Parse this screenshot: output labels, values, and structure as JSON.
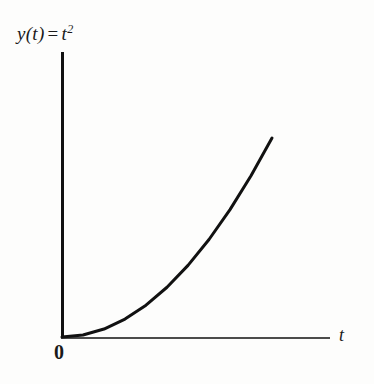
{
  "figure": {
    "background_color": "#fdfdfc",
    "ink_color": "#111111",
    "y_axis_label_main": "y(t)",
    "y_axis_label_operator": "=",
    "y_axis_label_var": "t",
    "y_axis_label_exponent": "2",
    "x_axis_label": "t",
    "origin_label": "0"
  },
  "chart_data": {
    "type": "line",
    "xlabel": "t",
    "ylabel": "y(t) = t²",
    "origin_tick_label": "0",
    "grid": false,
    "legend": null,
    "xlim": [
      0,
      1.18
    ],
    "ylim": [
      0,
      1.4
    ],
    "curve_color": "#111111",
    "curve_linewidth_px": 3,
    "axis_color": "#111111",
    "series": [
      {
        "name": "y = t^2",
        "x": [
          0.0,
          0.1,
          0.2,
          0.3,
          0.4,
          0.5,
          0.6,
          0.7,
          0.8,
          0.9,
          1.0
        ],
        "y": [
          0.0,
          0.01,
          0.04,
          0.09,
          0.16,
          0.25,
          0.36,
          0.49,
          0.64,
          0.81,
          1.0
        ]
      }
    ],
    "pixel_geometry": {
      "origin_px": [
        62,
        337
      ],
      "y_axis_top_px": [
        62,
        52
      ],
      "x_axis_right_px": [
        330,
        337
      ],
      "curve_end_px": [
        272,
        138
      ]
    }
  }
}
